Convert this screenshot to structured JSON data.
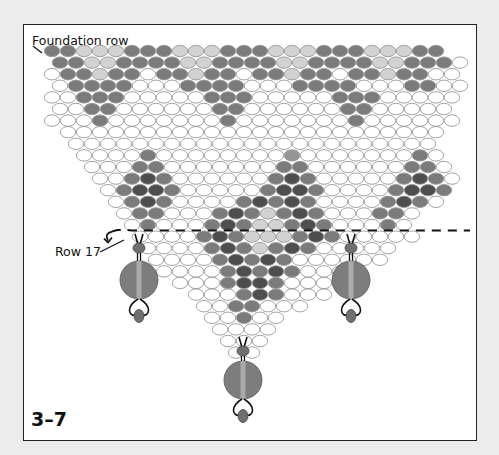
{
  "figure": {
    "number": "3–7",
    "labels": {
      "foundation": "Foundation row",
      "row17": "Row 17"
    }
  },
  "colors": {
    "D": "#4e4e4e",
    "M": "#7b7b7b",
    "G": "#959595",
    "L": "#d2d2d2",
    "W": "#ffffff",
    "outline": "#9a9a9a",
    "thread": "#111111",
    "dangle_big": "#7d7d7d",
    "dangle_small": "#6f6f6f"
  },
  "grid": {
    "bead_w": 16,
    "bead_h": 11.4,
    "row_step": 11.6,
    "y0": 51,
    "rows": [
      {
        "x": 52,
        "p": "MMLLLMMMLLLMMMLLLMMMLLLMM"
      },
      {
        "x": 60,
        "p": "MMLLMMMMLLMMMMLLMMMMLLMMMW"
      },
      {
        "x": 52,
        "p": "WMMLMMWMMLMMWMMLMMWMMLMMWW"
      },
      {
        "x": 60,
        "p": "WMMMMWWWMMMMWWWMMMMWWWMMWW"
      },
      {
        "x": 52,
        "p": "WWMMMWWWWWMMMWWWWWMMMWWWWW"
      },
      {
        "x": 60,
        "p": "WWMMWWWWWWMMWWWWWWMMWWWWW"
      },
      {
        "x": 52,
        "p": "WWWMWWWWWWWMWWWWWWWMWWWWWW"
      },
      {
        "x": 68,
        "p": "WWWWWWWWWWWWWWWWWWWWWWWW"
      },
      {
        "x": 76,
        "p": "WWWWWWWWWWWWWWWWWWWWWWW"
      },
      {
        "x": 84,
        "p": "WWWWMWWWWWWWWGWWWWWWWMW"
      },
      {
        "x": 92,
        "p": "WWWMMWWWWWWWMMWWWWWWMMW"
      },
      {
        "x": 100,
        "p": "WWMDMWWWWWWMDMWWWWWMDMW"
      },
      {
        "x": 108,
        "p": "WMDDMWWWWWMDDMWWWWMDDM"
      },
      {
        "x": 116,
        "p": "WMDMWWWWMDMDMWWWWMDMW"
      },
      {
        "x": 124,
        "p": "WMMWWWMDMLMDMWWWMMW"
      },
      {
        "x": 132,
        "p": "WMWWWMDMLLMDMWWWMW"
      },
      {
        "x": 140,
        "p": "WWWWMDMLLLMDMWWWWW"
      },
      {
        "x": 148,
        "p": "WWWWMDMLMDMWWWWW"
      },
      {
        "x": 156,
        "p": "WWWWMDMDMWWWWWW"
      },
      {
        "x": 164,
        "p": "WWWWMDMDMWWWW"
      },
      {
        "x": 180,
        "p": "WWWMDDMWWWW"
      },
      {
        "x": 196,
        "p": "WWWMDMWWW"
      },
      {
        "x": 204,
        "p": "WWMMWWW"
      },
      {
        "x": 212,
        "p": "WWMWW"
      },
      {
        "x": 220,
        "p": "WWWW"
      },
      {
        "x": 228,
        "p": "WWW"
      },
      {
        "x": 236,
        "p": "WW"
      }
    ]
  },
  "dangles": [
    {
      "x": 139,
      "y_top": 242,
      "r_big": 19,
      "y_big": 280
    },
    {
      "x": 351,
      "y_top": 242,
      "r_big": 19,
      "y_big": 280
    },
    {
      "x": 243,
      "y_top": 345,
      "r_big": 19,
      "y_big": 380
    }
  ]
}
